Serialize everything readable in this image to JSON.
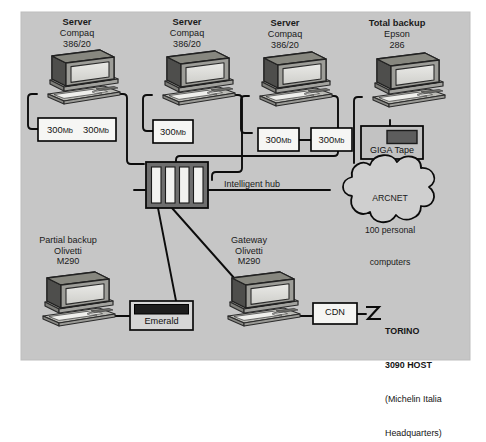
{
  "diagram": {
    "background_color": "#c9c9c9",
    "panel_color": "#c6c6c6",
    "line_color": "#000000",
    "box_fill": "#f4f4f2",
    "device_dark": "#4a4a4a"
  },
  "nodes": {
    "server1": {
      "role": "Server",
      "vendor": "Compaq",
      "model": "386/20"
    },
    "server2": {
      "role": "Server",
      "vendor": "Compaq",
      "model": "386/20"
    },
    "server3": {
      "role": "Server",
      "vendor": "Compaq",
      "model": "386/20"
    },
    "total_backup": {
      "role": "Total backup",
      "vendor": "Epson",
      "model": "286"
    },
    "partial_backup": {
      "role": "Partial backup",
      "vendor": "Olivetti",
      "model": "M290"
    },
    "gateway": {
      "role": "Gateway",
      "vendor": "Olivetti",
      "model": "M290"
    }
  },
  "storage": {
    "disk_a1": {
      "size": "300",
      "unit": "Mb"
    },
    "disk_a2": {
      "size": "300",
      "unit": "Mb"
    },
    "disk_b1": {
      "size": "300",
      "unit": "Mb"
    },
    "disk_c1": {
      "size": "300",
      "unit": "Mb"
    },
    "disk_c2": {
      "size": "300",
      "unit": "Mb"
    },
    "tape": {
      "label": "GIGA Tape"
    }
  },
  "devices": {
    "hub": {
      "label": "Intelligent hub",
      "slots": 4
    },
    "emerald": {
      "label": "Emerald"
    },
    "cdn": {
      "label": "CDN"
    }
  },
  "cloud": {
    "line1": "ARCNET",
    "line2": "100 personal",
    "line3": "computers"
  },
  "host": {
    "line1": "TORINO",
    "line2": "3090 HOST",
    "line3": "(Michelin Italia",
    "line4": "Headquarters)"
  },
  "icons": {
    "lightning": "lightning-icon",
    "monitor": "crt-monitor-icon",
    "keyboard": "keyboard-icon",
    "cloud": "network-cloud-icon",
    "hub": "hub-chassis-icon",
    "tape": "tape-drive-icon",
    "modem": "modem-icon"
  }
}
